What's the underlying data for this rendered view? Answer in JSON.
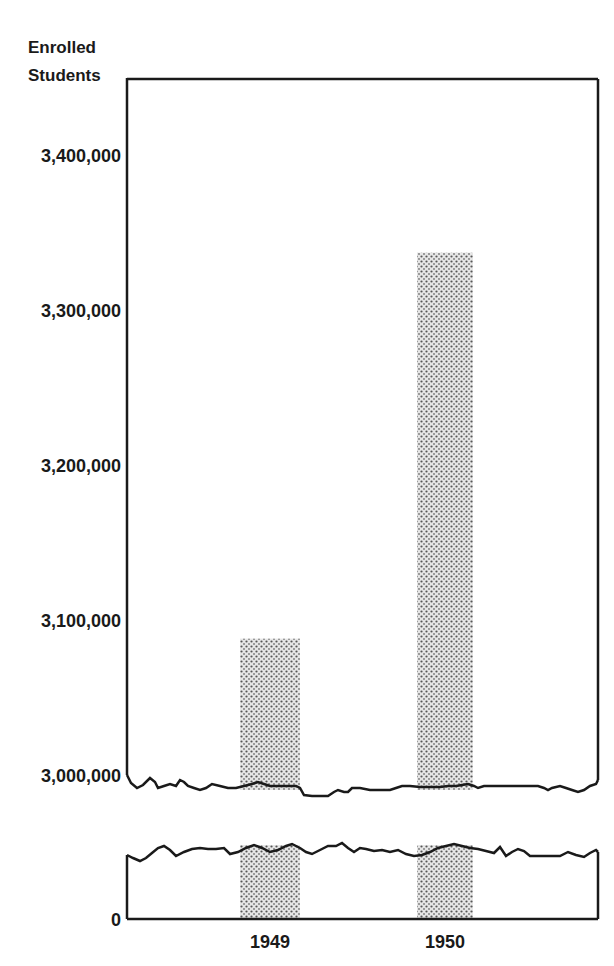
{
  "chart_data": {
    "type": "bar",
    "title": "",
    "ylabel": "Enrolled Students",
    "xlabel": "",
    "categories": [
      "1949",
      "1950"
    ],
    "values": [
      3088000,
      3337000
    ],
    "ylim": [
      3000000,
      3440000
    ],
    "axis_break": {
      "from": 0,
      "to": 3000000
    },
    "yticks": [
      {
        "value": 0,
        "label": "0"
      },
      {
        "value": 3000000,
        "label": "3,000,000"
      },
      {
        "value": 3100000,
        "label": "3,100,000"
      },
      {
        "value": 3200000,
        "label": "3,200,000"
      },
      {
        "value": 3300000,
        "label": "3,300,000"
      },
      {
        "value": 3400000,
        "label": "3,400,000"
      }
    ],
    "grid": false,
    "bar_fill": "stippled gray",
    "colors": {
      "bar": "#bdbdbd",
      "axis": "#1a1a1a",
      "background": "#ffffff"
    }
  },
  "ylabel_lines": [
    "Enrolled",
    "Students"
  ]
}
